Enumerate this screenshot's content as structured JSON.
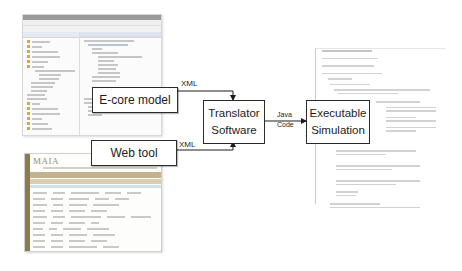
{
  "diagram": {
    "nodes": {
      "ecore_model": "E-core model",
      "web_tool": "Web tool",
      "translator_line1": "Translator",
      "translator_line2": "Software",
      "executable_line1": "Executable",
      "executable_line2": "Simulation"
    },
    "edges": {
      "ecore_to_translator": "XML",
      "webtool_to_translator": "XML",
      "translator_to_exec_line1": "Java",
      "translator_to_exec_line2": "Code"
    },
    "screenshots": {
      "eclipse": "eclipse-ide-screenshot",
      "web_tool_logo": "MAIA",
      "code": "java-code-screenshot"
    },
    "colors": {
      "box_border": "#2b2b2b",
      "web_sidebar": "#8a7a4e",
      "web_band": "#c2b38e"
    }
  }
}
